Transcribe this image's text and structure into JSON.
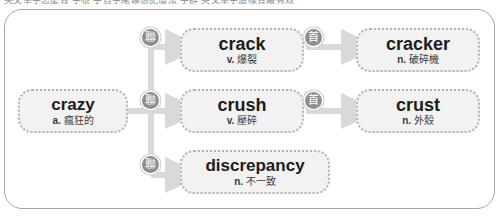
{
  "page": {
    "top_cut_text": "英文單字怎麼背 字根 字首字尾聯想記憶法 字群 英文單字這樣背最有效"
  },
  "diagram": {
    "type": "word-family-tree",
    "root": {
      "id": "crazy",
      "term": "crazy",
      "pos": "a.",
      "gloss": "瘋狂的"
    },
    "branches": [
      {
        "id": "crack",
        "term": "crack",
        "pos": "v.",
        "gloss": "爆裂",
        "badge": "聯",
        "badge_name": "association-icon",
        "derivative": {
          "id": "cracker",
          "term": "cracker",
          "pos": "n.",
          "gloss": "破碎機",
          "badge": "首",
          "badge_name": "prefix-icon"
        }
      },
      {
        "id": "crush",
        "term": "crush",
        "pos": "v.",
        "gloss": "壓碎",
        "badge": "聯",
        "badge_name": "association-icon",
        "derivative": {
          "id": "crust",
          "term": "crust",
          "pos": "n.",
          "gloss": "外殼",
          "badge": "首",
          "badge_name": "prefix-icon"
        }
      },
      {
        "id": "discrepancy",
        "term": "discrepancy",
        "pos": "n.",
        "gloss": "不一致",
        "badge": "聯",
        "badge_name": "association-icon",
        "derivative": null
      }
    ]
  },
  "colors": {
    "frame_border": "#a6a6a6",
    "box_fill": "#f2f2f2",
    "box_border": "#b5b5b5",
    "connector": "#d9d9d9",
    "badge_fill": "#8f8f8f",
    "term_text": "#1c1c1c",
    "gloss_text": "#3a3a3a"
  }
}
